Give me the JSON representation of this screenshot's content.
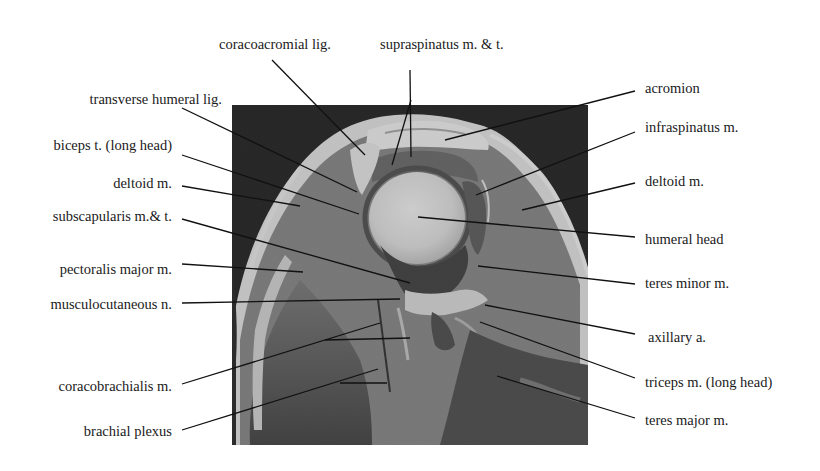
{
  "figure": {
    "type": "annotated-mri",
    "view": "oblique coronal shoulder",
    "colors": {
      "background": "#ffffff",
      "image_bg": "#0c0c0c",
      "leader_line": "#111111",
      "text": "#1a1a1a"
    }
  },
  "labels": {
    "top": [
      {
        "id": "coracoacromial-lig",
        "text": "coracoacromial lig."
      },
      {
        "id": "supraspinatus",
        "text": "supraspinatus m. & t."
      }
    ],
    "left": [
      {
        "id": "transverse-humeral-lig",
        "text": "transverse humeral lig."
      },
      {
        "id": "biceps-tendon",
        "text": "biceps t. (long head)"
      },
      {
        "id": "deltoid-left",
        "text": "deltoid m."
      },
      {
        "id": "subscapularis",
        "text": "subscapularis m.& t."
      },
      {
        "id": "pectoralis-major",
        "text": "pectoralis major m."
      },
      {
        "id": "musculocutaneous",
        "text": "musculocutaneous n."
      },
      {
        "id": "coracobrachialis",
        "text": "coracobrachialis m."
      },
      {
        "id": "brachial-plexus",
        "text": "brachial plexus"
      }
    ],
    "right": [
      {
        "id": "acromion",
        "text": "acromion"
      },
      {
        "id": "infraspinatus",
        "text": "infraspinatus m."
      },
      {
        "id": "deltoid-right",
        "text": "deltoid m."
      },
      {
        "id": "humeral-head",
        "text": "humeral head"
      },
      {
        "id": "teres-minor",
        "text": "teres minor m."
      },
      {
        "id": "axillary-a",
        "text": "axillary a."
      },
      {
        "id": "triceps-long-head",
        "text": "triceps m. (long head)"
      },
      {
        "id": "teres-major",
        "text": "teres major m."
      }
    ]
  }
}
